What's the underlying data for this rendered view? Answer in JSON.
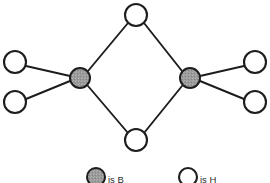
{
  "figure": {
    "background_color": "#ffffff",
    "bond_color": "#1d1d1d"
  },
  "colors": {
    "boron_fill": "#9a9a9a",
    "hydrogen_fill": "#ffffff",
    "outline": "#1d1d1d",
    "text": "#2b2b2b"
  },
  "atoms": {
    "boron": [
      {
        "id": "b-left",
        "label": "B",
        "cx": 80,
        "cy": 78,
        "r": 10
      },
      {
        "id": "b-right",
        "label": "B",
        "cx": 190,
        "cy": 78,
        "r": 10
      }
    ],
    "hydrogen_bridging": [
      {
        "id": "h-top",
        "label": "H",
        "cx": 136,
        "cy": 15,
        "r": 11
      },
      {
        "id": "h-bottom",
        "label": "H",
        "cx": 136,
        "cy": 140,
        "r": 11
      }
    ],
    "hydrogen_terminal": [
      {
        "id": "h-upper-left",
        "label": "H",
        "cx": 15,
        "cy": 62,
        "r": 11
      },
      {
        "id": "h-lower-left",
        "label": "H",
        "cx": 15,
        "cy": 102,
        "r": 11
      },
      {
        "id": "h-upper-right",
        "label": "H",
        "cx": 255,
        "cy": 62,
        "r": 11
      },
      {
        "id": "h-lower-right",
        "label": "H",
        "cx": 255,
        "cy": 102,
        "r": 11
      }
    ]
  },
  "bonds": [
    {
      "id": "bond-bleft-htop",
      "from": "b-left",
      "to": "h-top",
      "x1": 88,
      "y1": 71,
      "x2": 128,
      "y2": 23
    },
    {
      "id": "bond-bleft-hbottom",
      "from": "b-left",
      "to": "h-bottom",
      "x1": 88,
      "y1": 86,
      "x2": 128,
      "y2": 133
    },
    {
      "id": "bond-bright-htop",
      "from": "b-right",
      "to": "h-top",
      "x1": 182,
      "y1": 71,
      "x2": 144,
      "y2": 23
    },
    {
      "id": "bond-bright-hbottom",
      "from": "b-right",
      "to": "h-bottom",
      "x1": 182,
      "y1": 86,
      "x2": 144,
      "y2": 133
    },
    {
      "id": "bond-bleft-hupperleft",
      "from": "b-left",
      "to": "h-upper-left",
      "x1": 70,
      "y1": 76,
      "x2": 26,
      "y2": 66
    },
    {
      "id": "bond-bleft-hlowerleft",
      "from": "b-left",
      "to": "h-lower-left",
      "x1": 70,
      "y1": 81,
      "x2": 26,
      "y2": 99
    },
    {
      "id": "bond-bright-hupperright",
      "from": "b-right",
      "to": "h-upper-right",
      "x1": 200,
      "y1": 76,
      "x2": 244,
      "y2": 66
    },
    {
      "id": "bond-bright-hlowerright",
      "from": "b-right",
      "to": "h-lower-right",
      "x1": 200,
      "y1": 81,
      "x2": 244,
      "y2": 99
    }
  ],
  "legend": {
    "items": [
      {
        "id": "legend-boron",
        "swatch": "filled-gray-circle",
        "text": "is B",
        "cx": 96,
        "cy": 177,
        "r": 9,
        "text_x": 108
      },
      {
        "id": "legend-hydrogen",
        "swatch": "open-white-circle",
        "text": "is H",
        "cx": 188,
        "cy": 177,
        "r": 9,
        "text_x": 200
      }
    ]
  }
}
